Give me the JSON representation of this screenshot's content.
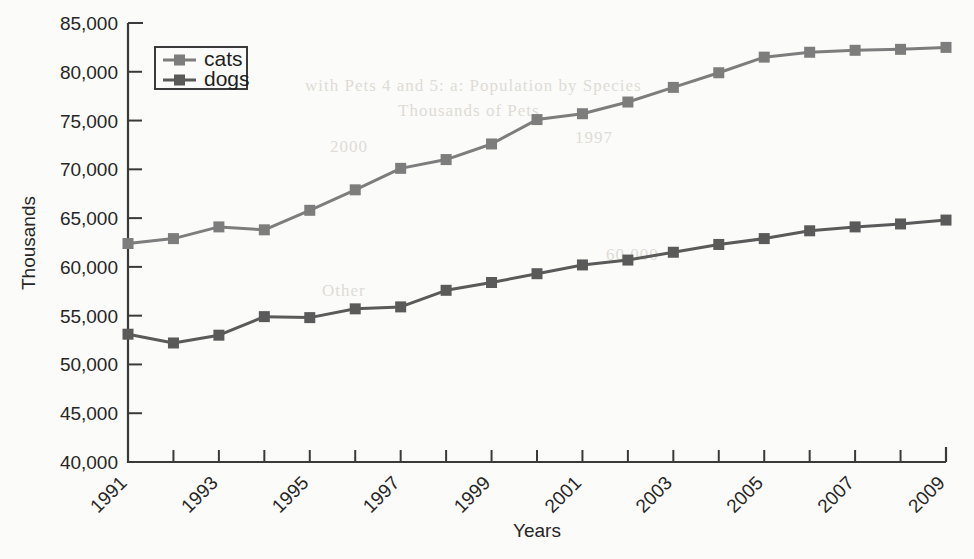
{
  "chart_data": {
    "type": "line",
    "title": "",
    "xlabel": "Years",
    "ylabel": "Thousands",
    "xlim": [
      1991,
      2009
    ],
    "ylim": [
      40000,
      85000
    ],
    "ytick_step": 5000,
    "grid": false,
    "legend_position": "top-left",
    "x": [
      1991,
      1992,
      1993,
      1994,
      1995,
      1996,
      1997,
      1998,
      1999,
      2000,
      2001,
      2002,
      2003,
      2004,
      2005,
      2006,
      2007,
      2008,
      2009
    ],
    "x_tick_labels": [
      "1991",
      "1993",
      "1995",
      "1997",
      "1999",
      "2001",
      "2003",
      "2005",
      "2007",
      "2009"
    ],
    "y_tick_labels": [
      "40,000",
      "45,000",
      "50,000",
      "55,000",
      "60,000",
      "65,000",
      "70,000",
      "75,000",
      "80,000",
      "85,000"
    ],
    "series": [
      {
        "name": "cats",
        "color": "#7d7d7d",
        "marker": "square",
        "values": [
          62400,
          62900,
          64100,
          63800,
          65800,
          67900,
          70100,
          71000,
          72600,
          75100,
          75700,
          76900,
          78400,
          79900,
          81500,
          82000,
          82200,
          82300,
          82500
        ]
      },
      {
        "name": "dogs",
        "color": "#5a5a5a",
        "marker": "square",
        "values": [
          53100,
          52200,
          53000,
          54900,
          54800,
          55700,
          55900,
          57600,
          58400,
          59300,
          60200,
          60700,
          61500,
          62300,
          62900,
          63700,
          64100,
          64400,
          64800
        ]
      }
    ]
  },
  "legend": {
    "entries": [
      "cats",
      "dogs"
    ]
  },
  "background_bleed": [
    "with Pets 4 and 5: a: Population by Species",
    "Thousands of Pets",
    "2000",
    "Other",
    "1997",
    "60,000"
  ]
}
